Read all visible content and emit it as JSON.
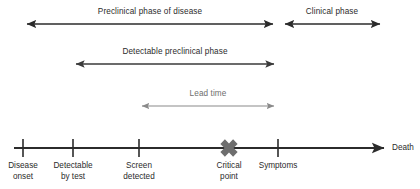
{
  "diagram": {
    "colors": {
      "dark": "#2b2b2b",
      "gray": "#6e6e6e",
      "light_gray": "#8a8a8a",
      "background": "#ffffff"
    },
    "spans": [
      {
        "id": "preclinical-phase",
        "label": "Preclinical phase of disease",
        "start_x": 24,
        "end_x": 276,
        "y": 24,
        "label_x": 150,
        "label_y": 7,
        "color": "#2b2b2b",
        "arrow": "double"
      },
      {
        "id": "clinical-phase",
        "label": "Clinical phase",
        "start_x": 282,
        "end_x": 383,
        "y": 24,
        "label_x": 332,
        "label_y": 7,
        "color": "#2b2b2b",
        "arrow": "double"
      },
      {
        "id": "detectable-preclinical-phase",
        "label": "Detectable preclinical phase",
        "start_x": 73,
        "end_x": 277,
        "y": 64,
        "label_x": 175,
        "label_y": 47,
        "color": "#3a3a3a",
        "arrow": "double"
      },
      {
        "id": "lead-time",
        "label": "Lead time",
        "start_x": 139,
        "end_x": 277,
        "y": 106,
        "label_x": 208,
        "label_y": 89,
        "color": "#8a8a8a",
        "arrow": "double"
      }
    ],
    "timeline": {
      "id": "disease-timeline",
      "y": 148,
      "start_x": 14,
      "end_x": 388,
      "end_label": "Death",
      "end_label_x": 392,
      "end_label_y": 143,
      "color": "#2b2b2b",
      "events": [
        {
          "id": "disease-onset",
          "x": 23,
          "line1": "Disease",
          "line2": "onset",
          "marker": "tick"
        },
        {
          "id": "detectable-by-test",
          "x": 73,
          "line1": "Detectable",
          "line2": "by test",
          "marker": "tick"
        },
        {
          "id": "screen-detected",
          "x": 139,
          "line1": "Screen",
          "line2": "detected",
          "marker": "tick"
        },
        {
          "id": "critical-point",
          "x": 229,
          "line1": "Critical",
          "line2": "point",
          "marker": "cross"
        },
        {
          "id": "symptoms",
          "x": 278,
          "line1": "Symptoms",
          "line2": "",
          "marker": "tick"
        }
      ],
      "label_y": 160
    }
  }
}
